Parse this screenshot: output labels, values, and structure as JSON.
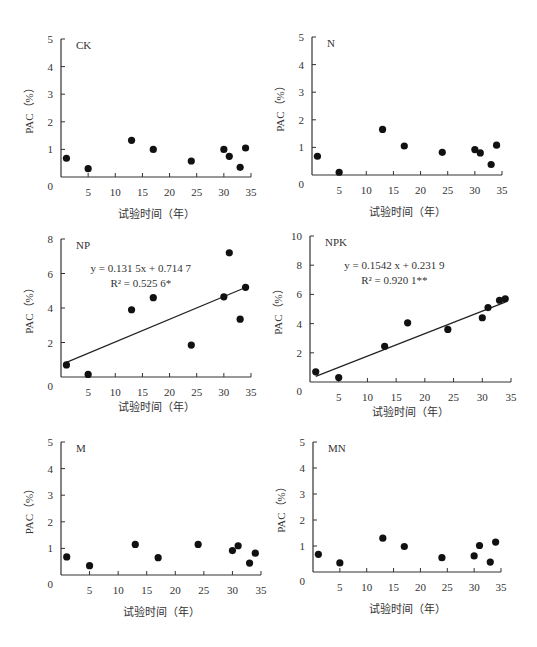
{
  "chart_data": [
    {
      "type": "scatter",
      "panel": "CK",
      "title": "CK",
      "xlabel": "试验时间（年）",
      "ylabel": "PAC（%）",
      "xlim": [
        0,
        35
      ],
      "ylim": [
        0,
        5
      ],
      "xticks": [
        5,
        10,
        15,
        20,
        25,
        30,
        35
      ],
      "yticks": [
        0,
        1,
        2,
        3,
        4,
        5
      ],
      "x": [
        1,
        5,
        13,
        17,
        24,
        30,
        31,
        33,
        34
      ],
      "y": [
        0.68,
        0.3,
        1.33,
        1.0,
        0.58,
        1.0,
        0.75,
        0.35,
        1.05
      ],
      "trendline": null
    },
    {
      "type": "scatter",
      "panel": "N",
      "title": "N",
      "xlabel": "试验时间（年）",
      "ylabel": "PAC（%）",
      "xlim": [
        0,
        35
      ],
      "ylim": [
        0,
        5
      ],
      "xticks": [
        5,
        10,
        15,
        20,
        25,
        30,
        35
      ],
      "yticks": [
        0,
        1,
        2,
        3,
        4,
        5
      ],
      "x": [
        1,
        5,
        13,
        17,
        24,
        30,
        31,
        33,
        34
      ],
      "y": [
        0.68,
        0.1,
        1.65,
        1.05,
        0.82,
        0.92,
        0.8,
        0.38,
        1.08
      ],
      "trendline": null
    },
    {
      "type": "scatter",
      "panel": "NP",
      "title": "NP",
      "xlabel": "试验时间（年）",
      "ylabel": "PAC（%）",
      "xlim": [
        0,
        35
      ],
      "ylim": [
        0,
        8
      ],
      "xticks": [
        5,
        10,
        15,
        20,
        25,
        30,
        35
      ],
      "yticks": [
        0,
        2,
        4,
        6,
        8
      ],
      "x": [
        1,
        5,
        13,
        17,
        24,
        30,
        31,
        33,
        34
      ],
      "y": [
        0.7,
        0.15,
        3.9,
        4.6,
        1.85,
        4.65,
        7.2,
        3.35,
        5.2
      ],
      "trendline": {
        "slope": 0.1315,
        "intercept": 0.7147,
        "x_range": [
          1,
          34
        ]
      },
      "equation": "y = 0.131 5x + 0.714 7",
      "r2": "R² = 0.525 6*"
    },
    {
      "type": "scatter",
      "panel": "NPK",
      "title": "NPK",
      "xlabel": "试验时间（年）",
      "ylabel": "PAC（%）",
      "xlim": [
        0,
        35
      ],
      "ylim": [
        0,
        10
      ],
      "xticks": [
        5,
        10,
        15,
        20,
        25,
        30,
        35
      ],
      "yticks": [
        0,
        2,
        4,
        6,
        8,
        10
      ],
      "x": [
        1,
        5,
        13,
        17,
        24,
        30,
        31,
        33,
        34
      ],
      "y": [
        0.7,
        0.3,
        2.45,
        4.05,
        3.6,
        4.4,
        5.1,
        5.6,
        5.7
      ],
      "trendline": {
        "slope": 0.1542,
        "intercept": 0.2319,
        "x_range": [
          1,
          34
        ]
      },
      "equation": "y = 0.1542 x + 0.231 9",
      "r2": "R² = 0.920 1**"
    },
    {
      "type": "scatter",
      "panel": "M",
      "title": "M",
      "xlabel": "试验时间（年）",
      "ylabel": "PAC（%）",
      "xlim": [
        0,
        35
      ],
      "ylim": [
        0,
        5
      ],
      "xticks": [
        5,
        10,
        15,
        20,
        25,
        30,
        35
      ],
      "yticks": [
        0,
        1,
        2,
        3,
        4,
        5
      ],
      "x": [
        1,
        5,
        13,
        17,
        24,
        30,
        31,
        33,
        34
      ],
      "y": [
        0.68,
        0.35,
        1.15,
        0.65,
        1.15,
        0.92,
        1.1,
        0.45,
        0.82
      ],
      "trendline": null
    },
    {
      "type": "scatter",
      "panel": "MN",
      "title": "MN",
      "xlabel": "试验时间（年）",
      "ylabel": "PAC（%）",
      "xlim": [
        0,
        35
      ],
      "ylim": [
        0,
        5
      ],
      "xticks": [
        5,
        10,
        15,
        20,
        25,
        30,
        35
      ],
      "yticks": [
        0,
        1,
        2,
        3,
        4,
        5
      ],
      "x": [
        1,
        5,
        13,
        17,
        24,
        30,
        31,
        33,
        34
      ],
      "y": [
        0.68,
        0.35,
        1.3,
        0.98,
        0.55,
        0.62,
        1.02,
        0.38,
        1.15
      ],
      "trendline": null
    }
  ],
  "layout": [
    {
      "left": 0,
      "top": 0,
      "w": 270,
      "h": 220,
      "ox": 61,
      "oy": 177,
      "pxw": 190,
      "pxh": 138
    },
    {
      "left": 270,
      "top": 0,
      "w": 267,
      "h": 220,
      "ox": 42,
      "oy": 175,
      "pxw": 190,
      "pxh": 138
    },
    {
      "left": 0,
      "top": 220,
      "w": 270,
      "h": 200,
      "ox": 61,
      "oy": 157,
      "pxw": 190,
      "pxh": 138
    },
    {
      "left": 270,
      "top": 220,
      "w": 267,
      "h": 200,
      "ox": 40,
      "oy": 162,
      "pxw": 201,
      "pxh": 146
    },
    {
      "left": 0,
      "top": 420,
      "w": 270,
      "h": 227,
      "ox": 61,
      "oy": 155,
      "pxw": 200,
      "pxh": 133
    },
    {
      "left": 270,
      "top": 420,
      "w": 267,
      "h": 227,
      "ox": 43,
      "oy": 152,
      "pxw": 188,
      "pxh": 130
    }
  ]
}
